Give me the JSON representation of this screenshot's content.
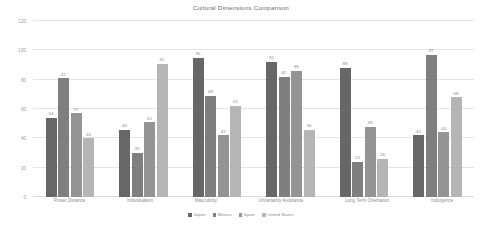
{
  "chart_data": {
    "type": "bar",
    "title": "Cultural Dimensions Comparison",
    "xlabel": "",
    "ylabel": "",
    "ylim": [
      0,
      120
    ],
    "yticks": [
      0,
      20,
      40,
      60,
      80,
      100,
      120
    ],
    "grid": true,
    "legend_position": "bottom",
    "categories": [
      "Power Distance",
      "Individualism",
      "Masculinity",
      "Uncertainty Avoidance",
      "Long Term Orientation",
      "Indulgence"
    ],
    "series": [
      {
        "name": "Japan",
        "color": "#676767",
        "values": [
          54,
          46,
          95,
          92,
          88,
          42
        ]
      },
      {
        "name": "Mexico",
        "color": "#7f7f7f",
        "values": [
          81,
          30,
          69,
          82,
          24,
          97
        ]
      },
      {
        "name": "Spain",
        "color": "#949494",
        "values": [
          57,
          51,
          42,
          86,
          48,
          44
        ]
      },
      {
        "name": "United States",
        "color": "#b5b5b5",
        "values": [
          40,
          91,
          62,
          46,
          26,
          68
        ]
      }
    ]
  }
}
